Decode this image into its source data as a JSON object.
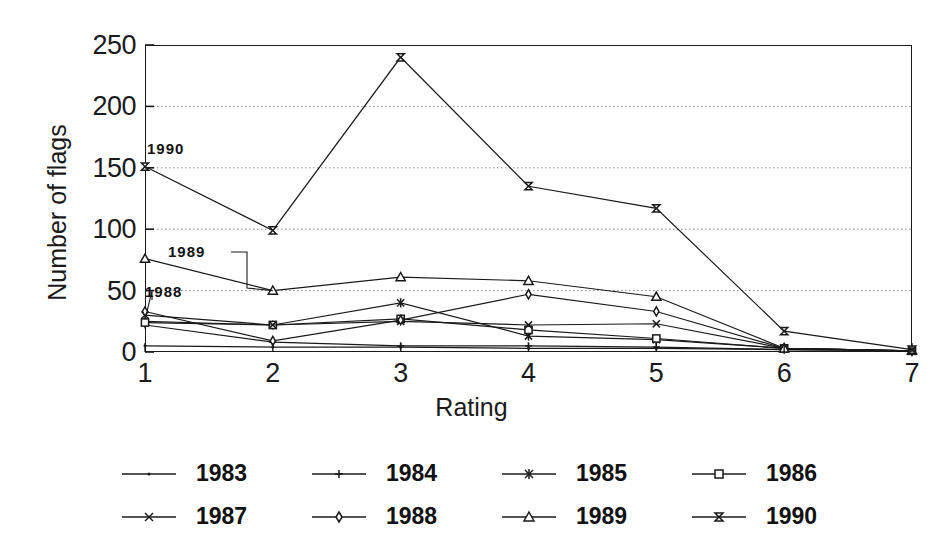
{
  "chart_data": {
    "type": "line",
    "title": "",
    "xlabel": "Rating",
    "ylabel": "Number of flags",
    "x": [
      1,
      2,
      3,
      4,
      5,
      6,
      7
    ],
    "xtick_labels": [
      "1",
      "2",
      "3",
      "4",
      "5",
      "6",
      "7"
    ],
    "ytick_labels": [
      "0",
      "50",
      "100",
      "150",
      "200",
      "250"
    ],
    "yticks": [
      0,
      50,
      100,
      150,
      200,
      250
    ],
    "ylim": [
      0,
      250
    ],
    "xlim": [
      1,
      7
    ],
    "grid": "horizontal-dotted",
    "legend_position": "bottom",
    "legend_columns": 4,
    "series": [
      {
        "name": "1983",
        "marker": "dot",
        "values": [
          5,
          4,
          4,
          3,
          3,
          2,
          1
        ]
      },
      {
        "name": "1984",
        "marker": "plus",
        "values": [
          22,
          8,
          5,
          5,
          4,
          2,
          1
        ]
      },
      {
        "name": "1985",
        "marker": "asterisk",
        "values": [
          25,
          22,
          40,
          13,
          10,
          3,
          1
        ]
      },
      {
        "name": "1986",
        "marker": "square",
        "values": [
          24,
          22,
          27,
          18,
          11,
          3,
          1
        ]
      },
      {
        "name": "1987",
        "marker": "cross",
        "values": [
          30,
          22,
          25,
          22,
          23,
          3,
          1
        ]
      },
      {
        "name": "1988",
        "marker": "diamond",
        "values": [
          33,
          9,
          26,
          47,
          33,
          3,
          1
        ]
      },
      {
        "name": "1989",
        "marker": "triangle",
        "values": [
          76,
          50,
          61,
          58,
          45,
          3,
          1
        ]
      },
      {
        "name": "1990",
        "marker": "bowtie",
        "values": [
          151,
          99,
          240,
          135,
          117,
          17,
          2
        ]
      }
    ],
    "annotations": [
      {
        "text": "1990",
        "series": "1990"
      },
      {
        "text": "1989",
        "series": "1989"
      },
      {
        "text": "1988",
        "series": "1988"
      }
    ]
  },
  "colors": {
    "line": "#1a1a1a",
    "grid": "#8a8a8a",
    "axis": "#1a1a1a",
    "background": "#ffffff"
  }
}
